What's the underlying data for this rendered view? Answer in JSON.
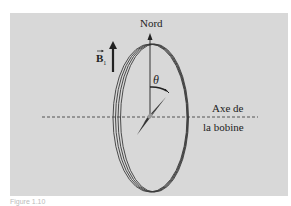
{
  "diagram": {
    "labels": {
      "north": "Nord",
      "field": "B",
      "field_subscript": "1",
      "angle": "θ",
      "axis_line1": "Axe de",
      "axis_line2": "la bobine"
    },
    "caption": "Figure 1.10",
    "colors": {
      "background_panel": "#d8d8d8",
      "ink": "#222222",
      "coil": "#3a3a3a",
      "needle_dark": "#333333",
      "needle_light": "#777777"
    },
    "coil_turns": 4,
    "angle_theta_deg": 35
  }
}
